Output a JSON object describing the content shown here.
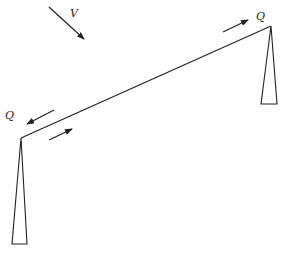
{
  "diagram": {
    "labels": {
      "wind_load": "V",
      "force_right": "Q",
      "force_left": "Q"
    },
    "elements": [
      "left-column",
      "right-column",
      "inclined-beam",
      "wind-arrow",
      "force-arrow-right-top",
      "force-arrow-left-outward",
      "force-arrow-left-inward"
    ]
  }
}
